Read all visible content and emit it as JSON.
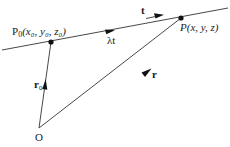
{
  "diagram": {
    "points": {
      "p0": {
        "label_prefix": "P",
        "label_sub": "0",
        "label_args": "(x₀, y₀, z₀)"
      },
      "p": {
        "label": "P(x, y, z)"
      },
      "origin": {
        "label": "O"
      }
    },
    "vectors": {
      "r0": {
        "label": "r",
        "sub": "0"
      },
      "r": {
        "label": "r"
      },
      "t": {
        "label": "t"
      },
      "lambda_t": {
        "label": "λt"
      }
    },
    "colors": {
      "stroke": "#333333",
      "text": "#222222",
      "background": "#ffffff"
    }
  }
}
